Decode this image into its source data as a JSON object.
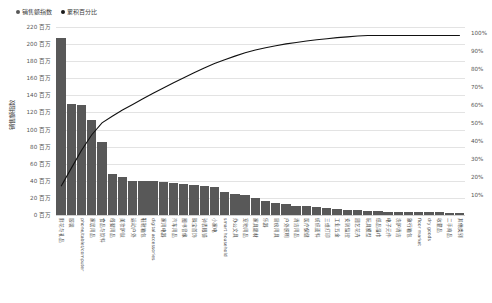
{
  "legend": {
    "series1": {
      "label": "销售额指数",
      "color": "#585858",
      "marker": "bullet-dot"
    },
    "series2": {
      "label": "累积百分比",
      "color": "#1a1a1a",
      "marker": "bullet-dot"
    }
  },
  "axes": {
    "y_title": "销售额指数",
    "y_ticks": [
      "0 百万",
      "20 百万",
      "40 百万",
      "60 百万",
      "80 百万",
      "100 百万",
      "120 百万",
      "140 百万",
      "160 百万",
      "180 百万",
      "200 百万",
      "220 百万"
    ],
    "y2_ticks": [
      "10%",
      "20%",
      "30%",
      "40%",
      "50%",
      "60%",
      "70%",
      "80%",
      "90%",
      "100%"
    ]
  },
  "chart_data": {
    "type": "bar",
    "title": "",
    "xlabel": "",
    "ylabel": "销售额指数",
    "y2label": "累积百分比",
    "ylim": [
      0,
      220
    ],
    "y2lim": [
      0,
      100
    ],
    "grid": true,
    "legend_position": "top-left",
    "categories": [
      "鲜花与礼品",
      "服装",
      "phone/tablet/computer",
      "家居用品",
      "食品与饮料",
      "母婴用品",
      "美妆护肤",
      "运动户外",
      "鞋靴箱包",
      "digital accessories",
      "家用电器",
      "汽车用品",
      "图书音像",
      "珠宝首饰",
      "钟表眼镜",
      "小家电",
      "smart household",
      "办公文具",
      "宠物用品",
      "家具建材",
      "乐器",
      "厨房用具",
      "户外照明",
      "清洁用品",
      "医疗保健",
      "纺织面料",
      "三维打印",
      "工业五金",
      "安防监控",
      "园艺花卉",
      "玩具模型",
      "纸品湿巾",
      "电子元件",
      "洗护清洁",
      "旅行箱包",
      "floor market",
      "dry goods",
      "收藏品",
      "二手商品",
      "其他类别"
    ],
    "values": [
      207,
      130,
      129,
      111,
      85,
      48,
      44,
      40,
      40,
      40,
      39,
      38,
      36,
      35,
      34,
      33,
      27,
      25,
      24,
      20,
      16,
      14,
      13,
      11,
      10,
      9,
      8,
      7,
      6,
      6,
      5,
      5,
      4,
      4,
      4,
      3,
      3,
      3,
      2,
      2
    ],
    "cumulative_percent": [
      16.0,
      26.1,
      36.1,
      44.7,
      51.3,
      55.0,
      58.5,
      61.6,
      64.7,
      67.8,
      70.8,
      73.7,
      76.5,
      79.2,
      81.9,
      84.4,
      86.5,
      88.5,
      90.4,
      91.9,
      93.2,
      94.3,
      95.3,
      96.1,
      96.9,
      97.6,
      98.2,
      98.8,
      99.2,
      99.7,
      100.0,
      100.0,
      100.0,
      100.0,
      100.0,
      100.0,
      100.0,
      100.0,
      100.0,
      100.0
    ]
  }
}
